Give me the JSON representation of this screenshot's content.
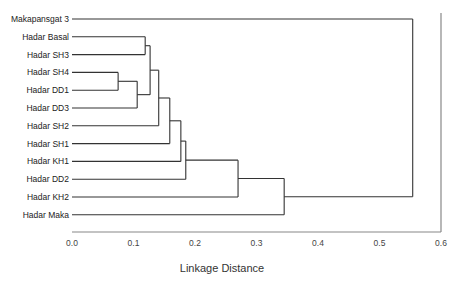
{
  "chart_data": {
    "type": "dendrogram",
    "title": "",
    "xlabel": "Linkage Distance",
    "ylabel": "",
    "xlim": [
      0.0,
      0.6
    ],
    "xticks": [
      "0.0",
      "0.1",
      "0.2",
      "0.3",
      "0.4",
      "0.5",
      "0.6"
    ],
    "xtick_values": [
      0.0,
      0.1,
      0.2,
      0.3,
      0.4,
      0.5,
      0.6
    ],
    "grid": false,
    "leaves": [
      "Makapansgat 3",
      "Hadar Basal",
      "Hadar SH3",
      "Hadar SH4",
      "Hadar DD1",
      "Hadar DD3",
      "Hadar SH2",
      "Hadar SH1",
      "Hadar KH1",
      "Hadar DD2",
      "Hadar KH2",
      "Hadar Maka"
    ],
    "merges": [
      {
        "id": "c1",
        "left": "Hadar SH4",
        "right": "Hadar DD1",
        "distance": 0.075
      },
      {
        "id": "c2",
        "left": "c1",
        "right": "Hadar DD3",
        "distance": 0.106
      },
      {
        "id": "c3",
        "left": "Hadar Basal",
        "right": "Hadar SH3",
        "distance": 0.119
      },
      {
        "id": "c4",
        "left": "c3",
        "right": "c2",
        "distance": 0.127
      },
      {
        "id": "c5",
        "left": "c4",
        "right": "Hadar SH2",
        "distance": 0.141
      },
      {
        "id": "c6",
        "left": "c5",
        "right": "Hadar SH1",
        "distance": 0.159
      },
      {
        "id": "c7",
        "left": "c6",
        "right": "Hadar KH1",
        "distance": 0.177
      },
      {
        "id": "c8",
        "left": "c7",
        "right": "Hadar DD2",
        "distance": 0.185
      },
      {
        "id": "c9",
        "left": "c8",
        "right": "Hadar KH2",
        "distance": 0.27
      },
      {
        "id": "c10",
        "left": "c9",
        "right": "Hadar Maka",
        "distance": 0.345
      },
      {
        "id": "c11",
        "left": "Makapansgat 3",
        "right": "c10",
        "distance": 0.554
      }
    ]
  }
}
